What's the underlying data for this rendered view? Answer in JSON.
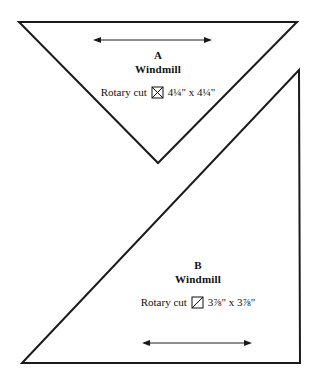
{
  "page": {
    "background_color": "#ffffff",
    "line_color": "#1a1a1a",
    "text_color": "#101010"
  },
  "pieces": [
    {
      "letter": "A",
      "name": "Windmill",
      "cut_prefix": "Rotary cut",
      "icon": "quarter-square-triangle-icon",
      "dimensions": "4¼\" x 4¼\"",
      "shape": "downward-triangle",
      "dimension_arrow": "double-headed-horizontal-arrow"
    },
    {
      "letter": "B",
      "name": "Windmill",
      "cut_prefix": "Rotary cut",
      "icon": "half-square-triangle-icon",
      "dimensions": "3⅞\" x 3⅞\"",
      "shape": "right-triangle",
      "dimension_arrow": "double-headed-horizontal-arrow"
    }
  ]
}
